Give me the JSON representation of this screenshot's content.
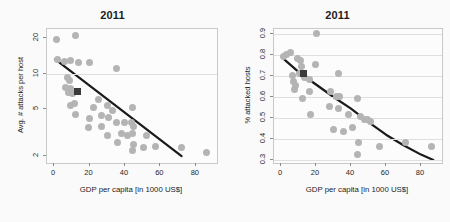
{
  "figure": {
    "background": "#fafafa",
    "point_color": "#b4b4b4",
    "highlight_color": "#3a3a3a",
    "curve_color": "#1a1a1a",
    "grid_color": "#dfdfdf"
  },
  "chart_data": [
    {
      "panel": "left",
      "type": "scatter",
      "title": "2011",
      "xlabel": "GDP per capita [in 1000 US$]",
      "ylabel": "Avg. # attacks per host",
      "xlim": [
        -4,
        92
      ],
      "ylim": [
        1.75,
        24
      ],
      "yscale": "log",
      "xscale": "linear",
      "xticks": [
        0,
        20,
        40,
        60,
        80
      ],
      "xticklabels": [
        "0",
        "20",
        "40",
        "60",
        "80"
      ],
      "yticks": [
        2,
        5,
        10,
        20
      ],
      "yticklabels": [
        "2",
        "5",
        "10",
        "20"
      ],
      "grid": "y-at-10-only",
      "gridlines_y": [
        10
      ],
      "legend": "none",
      "points": [
        {
          "x": 1.5,
          "y": 19.5
        },
        {
          "x": 12.0,
          "y": 21.0
        },
        {
          "x": 1.8,
          "y": 13.2
        },
        {
          "x": 6.0,
          "y": 12.8
        },
        {
          "x": 9.0,
          "y": 13.0
        },
        {
          "x": 14.0,
          "y": 12.6
        },
        {
          "x": 20.0,
          "y": 12.5
        },
        {
          "x": 35.0,
          "y": 11.0
        },
        {
          "x": 7.5,
          "y": 9.4
        },
        {
          "x": 8.5,
          "y": 8.7
        },
        {
          "x": 6.5,
          "y": 7.6
        },
        {
          "x": 9.5,
          "y": 7.5
        },
        {
          "x": 8.0,
          "y": 6.9
        },
        {
          "x": 10.5,
          "y": 6.8
        },
        {
          "x": 9.0,
          "y": 5.4
        },
        {
          "x": 11.5,
          "y": 5.6
        },
        {
          "x": 25.0,
          "y": 6.0
        },
        {
          "x": 22.5,
          "y": 5.2
        },
        {
          "x": 30.0,
          "y": 5.4
        },
        {
          "x": 33.0,
          "y": 4.9
        },
        {
          "x": 44.0,
          "y": 5.2
        },
        {
          "x": 12.0,
          "y": 4.5
        },
        {
          "x": 20.0,
          "y": 4.2
        },
        {
          "x": 27.0,
          "y": 4.4
        },
        {
          "x": 30.5,
          "y": 4.3
        },
        {
          "x": 19.5,
          "y": 3.5
        },
        {
          "x": 26.5,
          "y": 3.6
        },
        {
          "x": 35.0,
          "y": 3.9
        },
        {
          "x": 40.0,
          "y": 3.9
        },
        {
          "x": 43.5,
          "y": 3.9
        },
        {
          "x": 45.0,
          "y": 3.6
        },
        {
          "x": 30.0,
          "y": 3.0
        },
        {
          "x": 38.0,
          "y": 3.1
        },
        {
          "x": 41.5,
          "y": 3.0
        },
        {
          "x": 44.5,
          "y": 3.1
        },
        {
          "x": 52.0,
          "y": 3.0
        },
        {
          "x": 36.0,
          "y": 2.6
        },
        {
          "x": 45.0,
          "y": 2.5
        },
        {
          "x": 44.0,
          "y": 2.25
        },
        {
          "x": 50.5,
          "y": 2.35
        },
        {
          "x": 57.0,
          "y": 2.4
        },
        {
          "x": 72.0,
          "y": 2.35
        },
        {
          "x": 86.0,
          "y": 2.15
        }
      ],
      "highlight_point": {
        "x": 13.0,
        "y": 7.1,
        "marker": "square"
      },
      "fit_line": {
        "type": "log-linear",
        "points": [
          {
            "x": 0.5,
            "y": 13.3
          },
          {
            "x": 72.0,
            "y": 2.0
          }
        ]
      }
    },
    {
      "panel": "right",
      "type": "scatter",
      "title": "2011",
      "xlabel": "GDP per capita [in 1000 US$]",
      "ylabel": "% attacked hosts",
      "xlim": [
        -4,
        92
      ],
      "ylim": [
        0.285,
        0.925
      ],
      "yscale": "linear",
      "xscale": "linear",
      "xticks": [
        0,
        20,
        40,
        60,
        80
      ],
      "xticklabels": [
        "0",
        "20",
        "40",
        "60",
        "80"
      ],
      "yticks": [
        0.3,
        0.4,
        0.5,
        0.6,
        0.7,
        0.8,
        0.9
      ],
      "yticklabels": [
        "0.3",
        "0.4",
        "0.5",
        "0.6",
        "0.7",
        "0.8",
        "0.9"
      ],
      "grid": "horizontal",
      "gridlines_y": [
        0.3,
        0.4,
        0.5,
        0.6,
        0.7,
        0.8,
        0.9
      ],
      "legend": "none",
      "points": [
        {
          "x": 20.5,
          "y": 0.905
        },
        {
          "x": 1.5,
          "y": 0.795
        },
        {
          "x": 3.0,
          "y": 0.805
        },
        {
          "x": 5.5,
          "y": 0.815
        },
        {
          "x": 9.5,
          "y": 0.785
        },
        {
          "x": 11.0,
          "y": 0.775
        },
        {
          "x": 11.5,
          "y": 0.745
        },
        {
          "x": 19.5,
          "y": 0.755
        },
        {
          "x": 6.5,
          "y": 0.705
        },
        {
          "x": 10.5,
          "y": 0.715
        },
        {
          "x": 13.5,
          "y": 0.695
        },
        {
          "x": 16.0,
          "y": 0.685
        },
        {
          "x": 33.0,
          "y": 0.715
        },
        {
          "x": 7.0,
          "y": 0.675
        },
        {
          "x": 8.0,
          "y": 0.655
        },
        {
          "x": 7.5,
          "y": 0.635
        },
        {
          "x": 16.5,
          "y": 0.625
        },
        {
          "x": 28.5,
          "y": 0.625
        },
        {
          "x": 31.5,
          "y": 0.605
        },
        {
          "x": 33.5,
          "y": 0.605
        },
        {
          "x": 12.5,
          "y": 0.595
        },
        {
          "x": 43.5,
          "y": 0.595
        },
        {
          "x": 27.5,
          "y": 0.555
        },
        {
          "x": 33.0,
          "y": 0.545
        },
        {
          "x": 17.0,
          "y": 0.515
        },
        {
          "x": 38.5,
          "y": 0.515
        },
        {
          "x": 45.5,
          "y": 0.505
        },
        {
          "x": 47.5,
          "y": 0.495
        },
        {
          "x": 49.5,
          "y": 0.495
        },
        {
          "x": 51.0,
          "y": 0.485
        },
        {
          "x": 30.0,
          "y": 0.445
        },
        {
          "x": 35.5,
          "y": 0.435
        },
        {
          "x": 41.0,
          "y": 0.455
        },
        {
          "x": 44.5,
          "y": 0.385
        },
        {
          "x": 56.0,
          "y": 0.365
        },
        {
          "x": 71.0,
          "y": 0.385
        },
        {
          "x": 86.0,
          "y": 0.365
        },
        {
          "x": 43.5,
          "y": 0.325
        }
      ],
      "highlight_point": {
        "x": 13.0,
        "y": 0.715,
        "marker": "square"
      },
      "fit_line": {
        "type": "decay-curve",
        "points": [
          {
            "x": 0.5,
            "y": 0.79
          },
          {
            "x": 10.0,
            "y": 0.72
          },
          {
            "x": 20.0,
            "y": 0.66
          },
          {
            "x": 30.0,
            "y": 0.6
          },
          {
            "x": 40.0,
            "y": 0.545
          },
          {
            "x": 50.0,
            "y": 0.48
          },
          {
            "x": 60.0,
            "y": 0.42
          },
          {
            "x": 70.0,
            "y": 0.37
          },
          {
            "x": 80.0,
            "y": 0.325
          },
          {
            "x": 87.0,
            "y": 0.3
          }
        ]
      }
    }
  ]
}
